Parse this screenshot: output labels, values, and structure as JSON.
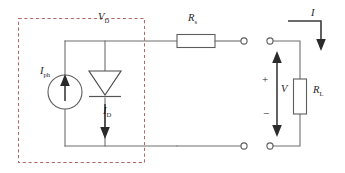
{
  "figure": {
    "background_color": "#ffffff",
    "wire_color": "#6f6f6f",
    "dashed_box_color": "#b06a6a",
    "label_color": "#1d1d1d"
  },
  "labels": {
    "diode_voltage": "V",
    "diode_voltage_sub": "D",
    "series_resistor": "R",
    "series_resistor_sub": "s",
    "output_current": "I",
    "photocurrent": "I",
    "photocurrent_sub": "ph",
    "diode_current": "I",
    "diode_current_sub": "D",
    "output_voltage": "V",
    "load_resistor": "R",
    "load_resistor_sub": "L",
    "polarity_positive": "+",
    "polarity_negative": "−"
  },
  "components": [
    {
      "name": "photocurrent-source",
      "type": "current-source",
      "symbol": "circle-with-up-arrow",
      "label": "I_ph",
      "orientation": "vertical",
      "current_direction": "up"
    },
    {
      "name": "diode",
      "type": "diode",
      "symbol": "triangle-with-cathode-bar",
      "label": "I_D",
      "voltage_label": "V_D",
      "orientation": "vertical",
      "anode": "top",
      "cathode": "bottom",
      "current_direction": "down"
    },
    {
      "name": "series-resistor",
      "type": "resistor",
      "symbol": "rectangle",
      "label": "R_s",
      "orientation": "horizontal"
    },
    {
      "name": "load-resistor",
      "type": "resistor",
      "symbol": "rectangle",
      "label": "R_L",
      "orientation": "vertical"
    },
    {
      "name": "terminal-top-left",
      "type": "terminal",
      "symbol": "open-circle"
    },
    {
      "name": "terminal-top-right",
      "type": "terminal",
      "symbol": "open-circle"
    },
    {
      "name": "terminal-bottom-left",
      "type": "terminal",
      "symbol": "open-circle"
    },
    {
      "name": "terminal-bottom-right",
      "type": "terminal",
      "symbol": "open-circle"
    }
  ],
  "annotations": [
    {
      "name": "dashed-enclosure",
      "meaning": "solar cell boundary",
      "style": "dashed rectangle"
    },
    {
      "name": "output-current-arrow",
      "label": "I",
      "direction": "down"
    },
    {
      "name": "output-voltage-arrow",
      "label": "V",
      "direction": "double-ended-vertical",
      "positive_terminal": "top",
      "negative_terminal": "bottom"
    }
  ]
}
